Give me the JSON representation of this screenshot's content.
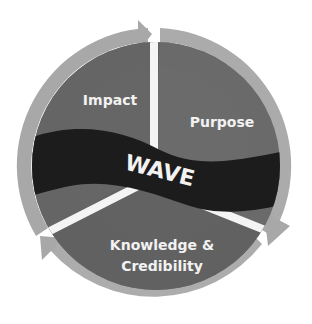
{
  "diagram": {
    "type": "cycle",
    "center_label": "WAVE",
    "segments": [
      {
        "label": "Impact",
        "position": "top-left"
      },
      {
        "label": "Purpose",
        "position": "right"
      },
      {
        "label_line1": "Knowledge &",
        "label_line2": "Credibility",
        "position": "bottom"
      }
    ],
    "colors": {
      "ring": "#a9a9a9",
      "segment": "#6b6b6b",
      "segment_dark": "#5e5e5e",
      "wave_band": "#1e1e1e",
      "text": "#f2f2f2",
      "background": "#ffffff"
    }
  }
}
